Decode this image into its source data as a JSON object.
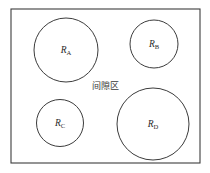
{
  "figure": {
    "background_color": "#ffffff",
    "stroke_color": "#3c3c3c",
    "text_color": "#2b2b2b"
  },
  "boundary": {
    "name": "outer-boundary-rectangle",
    "x": 11,
    "y": 9,
    "width": 189,
    "height": 154,
    "stroke_width": 1.1
  },
  "gap_region": {
    "label": "间隙区",
    "x": 105,
    "y": 89
  },
  "regions": [
    {
      "id": "A",
      "label_base": "R",
      "label_sub": "A",
      "cx": 66,
      "cy": 50,
      "r": 32,
      "stroke_width": 1.0
    },
    {
      "id": "B",
      "label_base": "R",
      "label_sub": "B",
      "cx": 154,
      "cy": 44,
      "r": 24,
      "stroke_width": 1.0
    },
    {
      "id": "C",
      "label_base": "R",
      "label_sub": "C",
      "cx": 60,
      "cy": 123,
      "r": 23.5,
      "stroke_width": 1.0
    },
    {
      "id": "D",
      "label_base": "R",
      "label_sub": "D",
      "cx": 153,
      "cy": 124,
      "r": 36,
      "stroke_width": 1.0
    }
  ]
}
